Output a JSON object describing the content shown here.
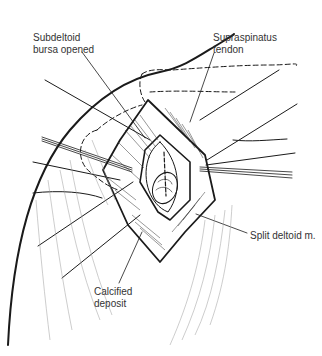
{
  "figure": {
    "type": "surgical-illustration",
    "labels": {
      "subdeltoid": {
        "line1": "Subdeltoid",
        "line2": "bursa opened"
      },
      "supraspinatus": {
        "line1": "Supraspinatus",
        "line2": "tendon"
      },
      "split_deltoid": {
        "line1": "Split deltoid m."
      },
      "calcified": {
        "line1": "Calcified",
        "line2": "deposit"
      }
    },
    "colors": {
      "line": "#1a1a1a",
      "hatching": "#9a9a9a",
      "label_text": "#333333",
      "background": "#ffffff"
    }
  }
}
